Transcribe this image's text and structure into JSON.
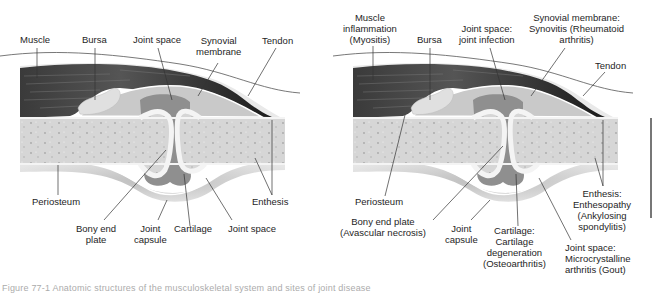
{
  "left_panel": {
    "title": "Normal joint anatomy",
    "labels": {
      "muscle": "Muscle",
      "bursa": "Bursa",
      "joint_space_top": "Joint space",
      "synovial_1": "Synovial",
      "synovial_2": "membrane",
      "tendon": "Tendon",
      "periosteum": "Periosteum",
      "enthesis": "Enthesis",
      "bony_1": "Bony end",
      "bony_2": "plate",
      "capsule_1": "Joint",
      "capsule_2": "capsule",
      "cartilage": "Cartilage",
      "joint_space_bottom": "Joint space"
    }
  },
  "right_panel": {
    "title": "Joint disease sites",
    "labels": {
      "muscle_1": "Muscle",
      "muscle_2": "inflammation",
      "muscle_3": "(Myositis)",
      "bursa": "Bursa",
      "joint_top_1": "Joint space:",
      "joint_top_2": "joint infection",
      "synovial_1": "Synovial membrane:",
      "synovial_2": "Synovitis (Rheumatoid",
      "synovial_3": "arthritis)",
      "tendon": "Tendon",
      "periosteum": "Periosteum",
      "bony_1": "Bony end plate",
      "bony_2": "(Avascular necrosis)",
      "capsule_1": "Joint",
      "capsule_2": "capsule",
      "cartilage_1": "Cartilage:",
      "cartilage_2": "Cartilage",
      "cartilage_3": "degeneration",
      "cartilage_4": "(Osteoarthritis)",
      "enthesis_1": "Enthesis:",
      "enthesis_2": "Enthesopathy",
      "enthesis_3": "(Ankylosing",
      "enthesis_4": "spondylitis)",
      "joint_bottom_1": "Joint space:",
      "joint_bottom_2": "Microcrystalline",
      "joint_bottom_3": "arthritis (Gout)"
    }
  },
  "caption": "Figure 77-1 Anatomic structures of the musculoskeletal system and sites of joint disease",
  "colors": {
    "muscle": "#2a2a2a",
    "bone": "#d9d9d9",
    "cartilage": "#f2f2f2",
    "synovium": "#9a9a9a",
    "capsule": "#c4c4c4",
    "line": "#333333"
  }
}
